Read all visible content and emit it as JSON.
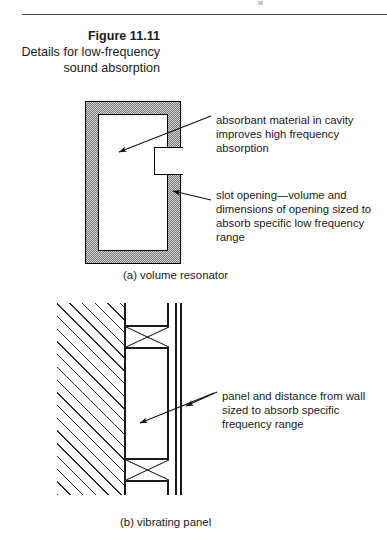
{
  "figure": {
    "number": "Figure 11.11",
    "description": "Details for low-frequency sound absorption"
  },
  "diagrams": [
    {
      "id": "volume-resonator",
      "caption": "(a) volume resonator",
      "annotations": [
        "absorbant material in cavity improves high frequency absorption",
        "slot opening—volume and dimensions of opening sized to absorb specific low frequency range"
      ]
    },
    {
      "id": "vibrating-panel",
      "caption": "(b) vibrating panel",
      "annotations": [
        "panel and distance from wall sized to absorb specific frequency range"
      ]
    }
  ],
  "colors": {
    "ink": "#1a1a1a",
    "rule": "#4a4a4a",
    "stipple_fill": "#d2d2d2",
    "stipple_dot": "#7a7a7a",
    "page": "#ffffff"
  }
}
